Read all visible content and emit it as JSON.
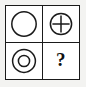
{
  "figure": {
    "background_color": "#f3f3f1",
    "cell_background_color": "#ffffff",
    "stroke_color": "#1a1a1a",
    "grid": {
      "rows": 2,
      "columns": 2,
      "border_width_px": 1.5
    }
  },
  "cells": [
    {
      "position": "top-left",
      "row": 1,
      "column": 1,
      "icon_name": "circle-outline-icon",
      "label": "circle",
      "description": "single empty outlined circle",
      "ring_count": 1,
      "has_plus": false,
      "is_answer_slot": false
    },
    {
      "position": "top-right",
      "row": 1,
      "column": 2,
      "icon_name": "circle-plus-icon",
      "label": "circle with plus",
      "description": "outlined circle containing a plus sign",
      "ring_count": 1,
      "has_plus": true,
      "is_answer_slot": false
    },
    {
      "position": "bottom-left",
      "row": 2,
      "column": 1,
      "icon_name": "concentric-circles-icon",
      "label": "double circle",
      "description": "two concentric outlined circles",
      "ring_count": 2,
      "has_plus": false,
      "is_answer_slot": false
    },
    {
      "position": "bottom-right",
      "row": 2,
      "column": 2,
      "icon_name": "question-mark-icon",
      "label": "?",
      "description": "bold question mark marking the missing answer",
      "ring_count": 0,
      "has_plus": false,
      "is_answer_slot": true
    }
  ],
  "answer_marker": {
    "symbol": "?"
  }
}
